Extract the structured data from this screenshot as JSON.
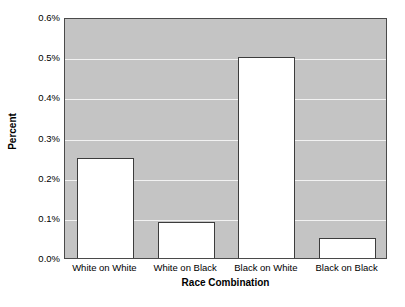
{
  "chart_data": {
    "type": "bar",
    "title": "",
    "xlabel": "Race Combination",
    "ylabel": "Percent",
    "categories": [
      "White on White",
      "White on Black",
      "Black on White",
      "Black on Black"
    ],
    "values": [
      0.25,
      0.09,
      0.5,
      0.05
    ],
    "value_labels": [
      "0.25%",
      "0.09%",
      "0.50%",
      "0.05%"
    ],
    "ylim": [
      0.0,
      0.6
    ],
    "ytick_values": [
      0.0,
      0.1,
      0.2,
      0.3,
      0.4,
      0.5,
      0.6
    ],
    "ytick_labels": [
      "0.0%",
      "0.1%",
      "0.2%",
      "0.3%",
      "0.4%",
      "0.5%",
      "0.6%"
    ],
    "grid": true,
    "grid_axis": "y",
    "legend": false,
    "legend_position": "none",
    "series": [
      {
        "name": "Percent",
        "values": [
          0.25,
          0.09,
          0.5,
          0.05
        ]
      }
    ],
    "colors": {
      "plot_background": "#c4c4c4",
      "gridline": "#f2f2f2",
      "bar_fill": "#ffffff",
      "bar_border": "#3c3c3c",
      "axis_border": "#4a4a4a",
      "text": "#000000",
      "page_background": "#ffffff"
    }
  }
}
